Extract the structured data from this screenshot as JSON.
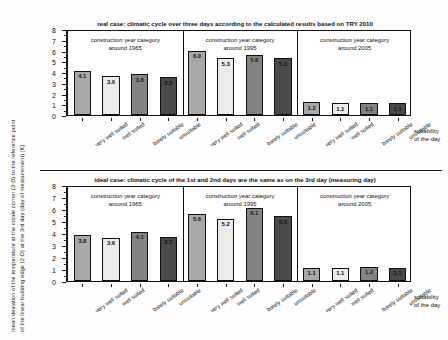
{
  "figure": {
    "y_axis_title_line1": "mean deviation of the temperature at the inside corner (3-D) to the reference point",
    "y_axis_title_line2": "of the linear building edge (2-D) at the 3rd day (day of measurement) [K]",
    "x_axis_title_line1": "suitability",
    "x_axis_title_line2": "of the day"
  },
  "chart_data": [
    {
      "type": "bar",
      "title": "real case: climatic cycle over three days according to the calculated results based on TRY 2010",
      "xlabel": "suitability of the day",
      "ylabel": "mean deviation of the temperature at the inside corner (3-D) to the reference point of the linear building edge (2-D) at the 3rd day (day of measurement) [K]",
      "ylim": [
        0,
        8
      ],
      "yticks": [
        0,
        1,
        2,
        3,
        4,
        5,
        6,
        7,
        8
      ],
      "grid": false,
      "legend": "none",
      "groups": [
        {
          "label_line1": "construction year category",
          "label_line2": "around 1965",
          "categories": [
            "very well suited",
            "well suited",
            "barely suitable",
            "unsuitable"
          ],
          "values": [
            4.1,
            3.6,
            3.8,
            3.5
          ]
        },
        {
          "label_line1": "construction year category",
          "label_line2": "around 1995",
          "categories": [
            "very well suited",
            "well suited",
            "barely suitable",
            "unsuitable"
          ],
          "values": [
            6.0,
            5.3,
            5.6,
            5.3
          ]
        },
        {
          "label_line1": "construction year category",
          "label_line2": "around 2005",
          "categories": [
            "very well suited",
            "well suited",
            "barely suitable",
            "unsuitable"
          ],
          "values": [
            1.2,
            1.1,
            1.1,
            1.1
          ]
        }
      ]
    },
    {
      "type": "bar",
      "title": "ideal case: climatic cycle of the 1st and 2nd days are the same as on the 3rd day (measuring day)",
      "xlabel": "suitability of the day",
      "ylabel": "mean deviation of the temperature at the inside corner (3-D) to the reference point of the linear building edge (2-D) at the 3rd day (day of measurement) [K]",
      "ylim": [
        0,
        8
      ],
      "yticks": [
        0,
        1,
        2,
        3,
        4,
        5,
        6,
        7,
        8
      ],
      "grid": false,
      "legend": "none",
      "groups": [
        {
          "label_line1": "construction year category",
          "label_line2": "around 1965",
          "categories": [
            "very well suited",
            "well suited",
            "barely suitable",
            "unsuitable"
          ],
          "values": [
            3.8,
            3.6,
            4.1,
            3.7
          ]
        },
        {
          "label_line1": "construction year category",
          "label_line2": "around 1995",
          "categories": [
            "very well suited",
            "well suited",
            "barely suitable",
            "unsuitable"
          ],
          "values": [
            5.6,
            5.2,
            6.1,
            5.4
          ]
        },
        {
          "label_line1": "construction year category",
          "label_line2": "around 2005",
          "categories": [
            "very well suited",
            "well suited",
            "barely suitable",
            "unsuitable"
          ],
          "values": [
            1.1,
            1.1,
            1.2,
            1.1
          ]
        }
      ]
    }
  ],
  "colors": {
    "bar_very_well_suited": "#a8a8a8",
    "bar_well_suited": "#ebebeb",
    "bar_barely_suitable": "#838383",
    "bar_unsuitable": "#4a4a4a",
    "axis": "#111111",
    "background": "#ffffff"
  }
}
